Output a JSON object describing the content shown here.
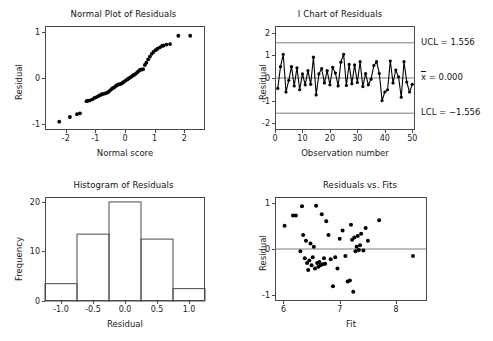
{
  "chart_data": [
    {
      "type": "scatter",
      "id": "normal-plot",
      "title": "Normal Plot of Residuals",
      "xlabel": "Normal score",
      "ylabel": "Residual",
      "xlim": [
        -2.7,
        2.7
      ],
      "ylim": [
        -1.12,
        1.12
      ],
      "xticks": [
        -2,
        -1,
        0,
        1,
        2
      ],
      "xticklabels": [
        "-2",
        "-1",
        "0",
        "1",
        "2"
      ],
      "yticks": [
        -1,
        0,
        1
      ],
      "yticklabels": [
        "-1",
        "0",
        "1"
      ],
      "grid": false,
      "x": [
        -2.22,
        -1.86,
        -1.62,
        -1.52,
        -1.3,
        -1.25,
        -1.18,
        -1.1,
        -1.03,
        -0.96,
        -0.9,
        -0.84,
        -0.78,
        -0.72,
        -0.67,
        -0.61,
        -0.56,
        -0.51,
        -0.46,
        -0.41,
        -0.36,
        -0.31,
        -0.26,
        -0.22,
        -0.17,
        -0.12,
        -0.08,
        -0.03,
        0.03,
        0.08,
        0.12,
        0.17,
        0.22,
        0.26,
        0.31,
        0.36,
        0.41,
        0.46,
        0.51,
        0.56,
        0.61,
        0.67,
        0.72,
        0.78,
        0.84,
        0.9,
        0.96,
        1.03,
        1.1,
        1.18,
        1.25,
        1.3,
        1.4,
        1.52,
        1.8,
        2.2
      ],
      "y": [
        -0.94,
        -0.84,
        -0.78,
        -0.76,
        -0.5,
        -0.49,
        -0.48,
        -0.46,
        -0.43,
        -0.41,
        -0.39,
        -0.37,
        -0.35,
        -0.34,
        -0.33,
        -0.32,
        -0.3,
        -0.27,
        -0.24,
        -0.22,
        -0.2,
        -0.17,
        -0.15,
        -0.14,
        -0.13,
        -0.12,
        -0.1,
        -0.08,
        -0.05,
        -0.03,
        -0.01,
        0.01,
        0.03,
        0.05,
        0.07,
        0.09,
        0.12,
        0.15,
        0.18,
        0.18,
        0.19,
        0.28,
        0.33,
        0.4,
        0.46,
        0.52,
        0.56,
        0.6,
        0.63,
        0.66,
        0.69,
        0.7,
        0.72,
        0.73,
        0.91,
        0.91
      ]
    },
    {
      "type": "line",
      "id": "i-chart",
      "title": "I Chart of Residuals",
      "xlabel": "Observation number",
      "ylabel": "Residual",
      "xlim": [
        0,
        51
      ],
      "ylim": [
        -2.3,
        2.3
      ],
      "xticks": [
        0,
        10,
        20,
        30,
        40,
        50
      ],
      "xticklabels": [
        "0",
        "10",
        "20",
        "30",
        "40",
        "50"
      ],
      "yticks": [
        -2,
        -1,
        0,
        1,
        2
      ],
      "yticklabels": [
        "-2",
        "-1",
        "0",
        "1",
        "2"
      ],
      "grid": false,
      "ucl": 1.556,
      "lcl": -1.556,
      "center": 0.0,
      "ucl_label": "UCL = 1.556",
      "center_label": "x = 0.000",
      "center_label_symbol": "x",
      "center_label_rest": " = 0.000",
      "lcl_label": "LCL = −1.556",
      "x": [
        1,
        2,
        3,
        4,
        5,
        6,
        7,
        8,
        9,
        10,
        11,
        12,
        13,
        14,
        15,
        16,
        17,
        18,
        19,
        20,
        21,
        22,
        23,
        24,
        25,
        26,
        27,
        28,
        29,
        30,
        31,
        32,
        33,
        34,
        35,
        36,
        37,
        38,
        39,
        40,
        41,
        42,
        43,
        44,
        45,
        46,
        47,
        48,
        49,
        50
      ],
      "values": [
        -0.46,
        0.5,
        1.05,
        -0.62,
        -0.1,
        0.5,
        -0.35,
        0.45,
        -0.52,
        0.18,
        -0.3,
        0.33,
        -0.28,
        0.92,
        -0.75,
        0.18,
        0.42,
        -0.22,
        0.33,
        -0.3,
        0.47,
        0.22,
        -0.35,
        0.7,
        1.05,
        -0.33,
        0.6,
        -0.25,
        0.58,
        -0.2,
        0.72,
        -0.38,
        0.2,
        -0.3,
        -0.05,
        0.55,
        0.72,
        0.2,
        -1.0,
        -0.62,
        -0.52,
        0.75,
        -0.22,
        0.35,
        0.05,
        -0.85,
        0.72,
        -0.18,
        -0.62,
        -0.28
      ]
    },
    {
      "type": "bar",
      "id": "histogram",
      "title": "Histogram of Residuals",
      "xlabel": "Residual",
      "ylabel": "Frequency",
      "xlim": [
        -1.25,
        1.25
      ],
      "ylim": [
        0,
        21
      ],
      "xticks": [
        -1.0,
        -0.5,
        0.0,
        0.5,
        1.0
      ],
      "xticklabels": [
        "-1.0",
        "-0.5",
        "0.0",
        "0.5",
        "1.0"
      ],
      "yticks": [
        0,
        10,
        20
      ],
      "yticklabels": [
        "0",
        "10",
        "20"
      ],
      "grid": false,
      "bin_edges": [
        -1.25,
        -0.75,
        -0.25,
        0.25,
        0.75,
        1.25
      ],
      "categories": [
        "-1.0",
        "-0.5",
        "0.0",
        "0.5",
        "1.0"
      ],
      "values": [
        3.5,
        13.5,
        20,
        12.5,
        2.5
      ]
    },
    {
      "type": "scatter",
      "id": "resid-vs-fits",
      "title": "Residuals vs. Fits",
      "xlabel": "Fit",
      "ylabel": "Residual",
      "xlim": [
        5.85,
        8.55
      ],
      "ylim": [
        -1.12,
        1.12
      ],
      "xticks": [
        6,
        7,
        8
      ],
      "xticklabels": [
        "6",
        "7",
        "8"
      ],
      "yticks": [
        -1,
        0,
        1
      ],
      "yticklabels": [
        "-1",
        "0",
        "1"
      ],
      "grid": false,
      "reference_line_y": 0,
      "x": [
        6.02,
        6.17,
        6.22,
        6.3,
        6.33,
        6.35,
        6.38,
        6.4,
        6.42,
        6.44,
        6.46,
        6.48,
        6.5,
        6.52,
        6.54,
        6.56,
        6.58,
        6.6,
        6.62,
        6.64,
        6.66,
        6.68,
        6.7,
        6.72,
        6.74,
        6.76,
        6.8,
        6.84,
        6.88,
        6.92,
        6.96,
        7.0,
        7.05,
        7.1,
        7.14,
        7.18,
        7.2,
        7.22,
        7.24,
        7.26,
        7.28,
        7.3,
        7.32,
        7.34,
        7.36,
        7.38,
        7.42,
        7.46,
        7.5,
        7.7,
        8.3
      ],
      "y": [
        0.5,
        0.72,
        0.72,
        -0.05,
        0.92,
        0.3,
        -0.2,
        0.18,
        -0.3,
        -0.45,
        -0.25,
        0.12,
        -0.35,
        -0.18,
        0.05,
        -0.42,
        0.93,
        -0.3,
        -0.38,
        -0.28,
        -0.35,
        0.75,
        -0.33,
        -0.2,
        -0.32,
        0.6,
        0.3,
        -0.22,
        -0.8,
        -0.18,
        -0.42,
        0.22,
        0.4,
        -0.15,
        -0.7,
        -0.68,
        0.52,
        0.2,
        -0.92,
        0.25,
        -0.05,
        0.05,
        0.28,
        -0.02,
        0.08,
        0.33,
        -0.03,
        0.45,
        0.18,
        0.62,
        -0.15
      ]
    }
  ]
}
